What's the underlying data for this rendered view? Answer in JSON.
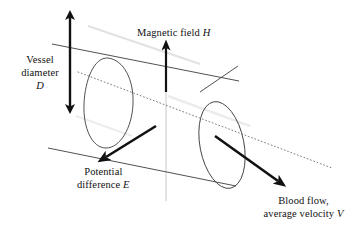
{
  "figure": {
    "background_color": "#ffffff",
    "stroke_color": "#111111",
    "thin_stroke_color": "#4a4a4a",
    "dotted_axis_color": "#777777",
    "faint_line_color": "#c9c9c9"
  },
  "labels": {
    "vessel_diameter": {
      "line1": "Vessel",
      "line2": "diameter",
      "symbol": "D"
    },
    "magnetic_field": {
      "text": "Magnetic field",
      "symbol": "H"
    },
    "potential_difference": {
      "line1": "Potential",
      "line2": "difference",
      "symbol": "E"
    },
    "blood_flow": {
      "line1": "Blood flow,",
      "line2": "average velocity",
      "symbol": "V"
    }
  },
  "arrows": {
    "vessel_diameter_arrow": {
      "kind": "double-headed-vertical",
      "x": 70,
      "y_top": 11,
      "y_bottom": 113
    },
    "magnetic_field_arrow": {
      "kind": "single-headed-up",
      "x": 166,
      "y_tail": 92,
      "y_head": 42
    },
    "potential_difference_arrow": {
      "kind": "single-headed-down-left",
      "x_tail": 155,
      "y_tail": 126,
      "x_head": 101,
      "y_head": 160
    },
    "blood_flow_arrow": {
      "kind": "single-headed-down-right",
      "x_tail": 215,
      "y_tail": 136,
      "x_head": 284,
      "y_head": 185
    }
  },
  "shapes": {
    "cylinder": {
      "description": "oblique cylinder representing a blood vessel",
      "left_ellipse_center": [
        108,
        103
      ],
      "right_ellipse_center": [
        222,
        145
      ],
      "ellipse_rx": 22,
      "ellipse_ry": 44,
      "tilt_deg": -20
    },
    "dotted_center_axis": {
      "from": [
        78,
        72
      ],
      "to": [
        330,
        167
      ]
    },
    "vertical_center_line": {
      "x": 166,
      "from_y": 42,
      "to_y": 200
    }
  }
}
